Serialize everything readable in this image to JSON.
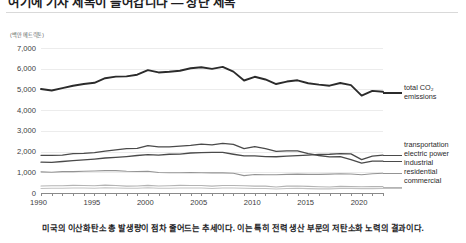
{
  "header": {
    "title": "여기에 기사 제목이 들어갑니다 — 상단 제목"
  },
  "caption": "미국의 이산화탄소 총 발생량이 점차 줄어드는 추세이다. 이는 특히 전력 생산 부문의 저탄소화 노력의 결과이다.",
  "chart_data": {
    "type": "line",
    "title": "",
    "xlabel": "",
    "ylabel": "(백만 메트릭톤)",
    "unit_label": "(백만 메트릭톤)",
    "ylim": [
      0,
      7000
    ],
    "xlim": [
      1990,
      2022
    ],
    "ytick_labels": [
      "7,000",
      "6,000",
      "5,000",
      "4,000",
      "3,000",
      "2,000",
      "1,000",
      "0"
    ],
    "yticks": [
      7000,
      6000,
      5000,
      4000,
      3000,
      2000,
      1000,
      0
    ],
    "xtick_labels": [
      "1990",
      "1995",
      "2000",
      "2005",
      "2010",
      "2015",
      "2020"
    ],
    "xticks": [
      1990,
      1995,
      2000,
      2005,
      2010,
      2015,
      2020
    ],
    "grid": true,
    "legend_position": "right",
    "x": [
      1990,
      1991,
      1992,
      1993,
      1994,
      1995,
      1996,
      1997,
      1998,
      1999,
      2000,
      2001,
      2002,
      2003,
      2004,
      2005,
      2006,
      2007,
      2008,
      2009,
      2010,
      2011,
      2012,
      2013,
      2014,
      2015,
      2016,
      2017,
      2018,
      2019,
      2020,
      2021,
      2022
    ],
    "series": [
      {
        "name": "total CO₂ emissions",
        "legend_label": "total CO2 emissions",
        "color": "#2b2b2b",
        "width": 1.9,
        "values": [
          5020,
          4950,
          5060,
          5180,
          5260,
          5320,
          5540,
          5620,
          5630,
          5710,
          5930,
          5820,
          5850,
          5900,
          6020,
          6070,
          5990,
          6090,
          5860,
          5430,
          5610,
          5480,
          5260,
          5380,
          5440,
          5300,
          5230,
          5180,
          5310,
          5210,
          4700,
          4930,
          4890
        ]
      },
      {
        "name": "transportation",
        "legend_label": "transportation",
        "color": "#4a4a4a",
        "width": 1.3,
        "values": [
          1490,
          1480,
          1520,
          1560,
          1600,
          1640,
          1690,
          1720,
          1760,
          1810,
          1850,
          1830,
          1870,
          1880,
          1930,
          1950,
          1960,
          1960,
          1870,
          1790,
          1790,
          1760,
          1750,
          1780,
          1800,
          1830,
          1860,
          1870,
          1900,
          1890,
          1610,
          1780,
          1830
        ]
      },
      {
        "name": "electric power",
        "legend_label": "electric power",
        "color": "#4a4a4a",
        "width": 1.3,
        "values": [
          1820,
          1820,
          1830,
          1900,
          1910,
          1950,
          2020,
          2080,
          2140,
          2150,
          2290,
          2230,
          2230,
          2260,
          2300,
          2360,
          2320,
          2400,
          2350,
          2140,
          2240,
          2140,
          2010,
          2030,
          2030,
          1900,
          1810,
          1740,
          1760,
          1610,
          1440,
          1540,
          1540
        ]
      },
      {
        "name": "industrial",
        "legend_label": "industrial",
        "color": "#949494",
        "width": 1.1,
        "values": [
          1020,
          1000,
          1030,
          1030,
          1050,
          1060,
          1080,
          1080,
          1050,
          1040,
          1050,
          990,
          980,
          980,
          990,
          980,
          970,
          970,
          950,
          840,
          890,
          880,
          880,
          900,
          910,
          900,
          900,
          910,
          930,
          920,
          880,
          930,
          950
        ]
      },
      {
        "name": "residential",
        "legend_label": "residential",
        "color": "#b4b4b4",
        "width": 1.1,
        "values": [
          340,
          350,
          350,
          370,
          360,
          350,
          380,
          360,
          330,
          340,
          370,
          340,
          350,
          370,
          360,
          360,
          330,
          360,
          360,
          350,
          330,
          330,
          290,
          330,
          340,
          320,
          300,
          290,
          320,
          310,
          300,
          310,
          310
        ]
      },
      {
        "name": "commercial",
        "legend_label": "commercial",
        "color": "#c2c2c2",
        "width": 1.1,
        "values": [
          220,
          230,
          230,
          240,
          240,
          230,
          250,
          240,
          230,
          230,
          250,
          230,
          230,
          240,
          240,
          240,
          220,
          240,
          240,
          230,
          220,
          220,
          190,
          220,
          230,
          210,
          200,
          200,
          220,
          220,
          210,
          210,
          220
        ]
      }
    ]
  }
}
